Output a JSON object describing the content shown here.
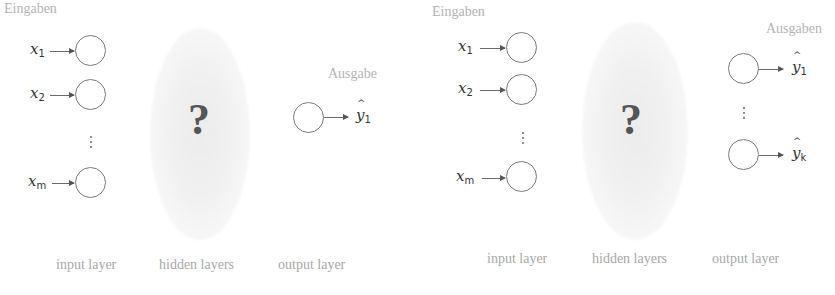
{
  "left_diagram": {
    "inputs_heading": "Eingaben",
    "outputs_heading": "Ausgabe",
    "inputs": [
      {
        "symbol": "x",
        "index": "1"
      },
      {
        "symbol": "x",
        "index": "2"
      },
      {
        "symbol": "x",
        "index": "m"
      }
    ],
    "hidden_symbol": "?",
    "outputs": [
      {
        "symbol": "y",
        "index": "1"
      }
    ],
    "layer_labels": [
      "input layer",
      "hidden layers",
      "output layer"
    ]
  },
  "right_diagram": {
    "inputs_heading": "Eingaben",
    "outputs_heading": "Ausgaben",
    "inputs": [
      {
        "symbol": "x",
        "index": "1"
      },
      {
        "symbol": "x",
        "index": "2"
      },
      {
        "symbol": "x",
        "index": "m"
      }
    ],
    "hidden_symbol": "?",
    "outputs": [
      {
        "symbol": "y",
        "index": "1"
      },
      {
        "symbol": "y",
        "index": "k"
      }
    ],
    "layer_labels": [
      "input layer",
      "hidden layers",
      "output layer"
    ]
  },
  "colors": {
    "heading": "#b3b3b3",
    "label": "#a8a8a8",
    "node_stroke": "#7a7a7a",
    "question_mark": "#555555",
    "hidden_cloud": "#ececec"
  }
}
